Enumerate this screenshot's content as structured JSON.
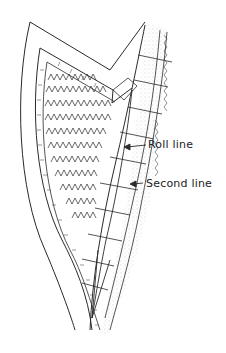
{
  "figure": {
    "labels": {
      "roll_line": "Roll line",
      "second_line": "Second line"
    },
    "colors": {
      "ink": "#2a2a2a",
      "stipple": "#9a9a9a",
      "background": "#ffffff"
    }
  }
}
